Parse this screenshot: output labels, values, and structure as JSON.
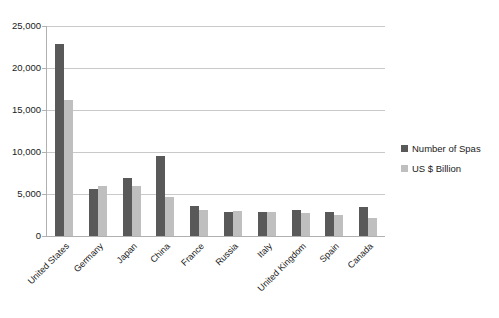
{
  "chart_data": {
    "type": "bar",
    "title": "",
    "subtitle": "",
    "xlabel": "",
    "ylabel": "",
    "ylim": [
      0,
      25000
    ],
    "ytick_labels": [
      "25,000",
      "20,000",
      "15,000",
      "10,000",
      "5,000",
      "0"
    ],
    "ytick_values": [
      25000,
      20000,
      15000,
      10000,
      5000,
      0
    ],
    "grid": true,
    "legend_position": "right",
    "categories": [
      "United States",
      "Germany",
      "Japan",
      "China",
      "France",
      "Russia",
      "Italy",
      "United Kingdom",
      "Spain",
      "Canada"
    ],
    "series": [
      {
        "name": "Number of Spas",
        "color": "#595959",
        "values": [
          22900,
          5600,
          6900,
          9500,
          3600,
          2900,
          2900,
          3100,
          2900,
          3500
        ]
      },
      {
        "name": "US $ Billion",
        "color": "#bfbfbf",
        "values": [
          16200,
          5900,
          5900,
          4700,
          3100,
          2950,
          2900,
          2700,
          2450,
          2200
        ]
      }
    ]
  },
  "legend": {
    "items": [
      {
        "label": "Number of Spas",
        "color": "#595959"
      },
      {
        "label": "US $ Billion",
        "color": "#bfbfbf"
      }
    ]
  }
}
